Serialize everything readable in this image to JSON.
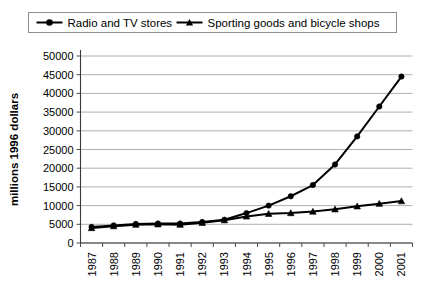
{
  "chart_data": {
    "type": "line",
    "title": "",
    "xlabel": "",
    "ylabel": "millions 1996 dollars",
    "categories": [
      "1987",
      "1988",
      "1989",
      "1990",
      "1991",
      "1992",
      "1993",
      "1994",
      "1995",
      "1996",
      "1997",
      "1998",
      "1999",
      "2000",
      "2001"
    ],
    "ylim": [
      0,
      50000
    ],
    "ytick_values": [
      0,
      5000,
      10000,
      15000,
      20000,
      25000,
      30000,
      35000,
      40000,
      45000,
      50000
    ],
    "ytick_labels": [
      "0",
      "5000",
      "10000",
      "15000",
      "20000",
      "25000",
      "30000",
      "35000",
      "40000",
      "45000",
      "50000"
    ],
    "grid": true,
    "grid_axis": "y",
    "legend_position": "top",
    "series": [
      {
        "name": "Radio and TV stores",
        "marker": "circle",
        "color": "#000000",
        "values": [
          4300,
          4700,
          5100,
          5200,
          5200,
          5600,
          6200,
          8000,
          10000,
          12500,
          15500,
          21000,
          28500,
          36500,
          44500
        ]
      },
      {
        "name": "Sporting goods and bicycle shops",
        "marker": "triangle",
        "color": "#000000",
        "values": [
          4000,
          4500,
          4900,
          5000,
          4900,
          5400,
          6100,
          7100,
          7800,
          8000,
          8400,
          9000,
          9800,
          10500,
          11200
        ]
      }
    ]
  },
  "legend": {
    "items": [
      {
        "label": "Radio and TV stores",
        "marker": "circle"
      },
      {
        "label": "Sporting goods and bicycle shops",
        "marker": "triangle"
      }
    ]
  },
  "axes": {
    "y_axis_title": "millions 1996 dollars"
  }
}
